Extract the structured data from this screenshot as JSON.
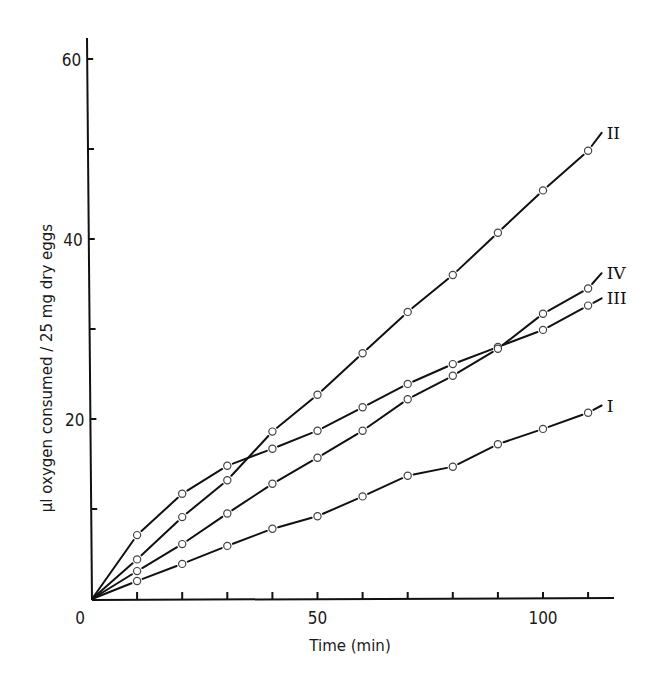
{
  "chart_data": {
    "type": "line",
    "title": "",
    "xlabel": "Time (min)",
    "ylabel": "µl oxygen consumed / 25 mg  dry eggs",
    "xlim": [
      0,
      117
    ],
    "ylim": [
      0,
      62
    ],
    "x_ticks": [
      0,
      10,
      20,
      30,
      40,
      50,
      60,
      70,
      80,
      90,
      100,
      110
    ],
    "x_tick_labels": [
      {
        "value": 0,
        "label": "0"
      },
      {
        "value": 50,
        "label": "50"
      },
      {
        "value": 100,
        "label": "100"
      }
    ],
    "y_ticks": [
      0,
      10,
      20,
      30,
      40,
      50,
      60
    ],
    "y_tick_labels": [
      {
        "value": 20,
        "label": "20"
      },
      {
        "value": 40,
        "label": "40"
      },
      {
        "value": 60,
        "label": "60"
      }
    ],
    "origin_label": "0",
    "grid": false,
    "legend": "inline labels at line ends",
    "marker": "open circle",
    "x": [
      0,
      10,
      20,
      30,
      40,
      50,
      60,
      70,
      80,
      90,
      100,
      110
    ],
    "series": [
      {
        "name": "I",
        "values": [
          0,
          2.0,
          3.9,
          5.9,
          7.8,
          9.2,
          11.4,
          13.7,
          14.7,
          17.2,
          18.9,
          20.7
        ],
        "end": [
          113,
          21.5
        ]
      },
      {
        "name": "II",
        "values": [
          0,
          4.4,
          9.1,
          13.2,
          18.6,
          22.7,
          27.3,
          31.9,
          36.0,
          40.7,
          45.4,
          49.8
        ],
        "end": [
          113,
          51.8
        ]
      },
      {
        "name": "III",
        "values": [
          0,
          7.1,
          11.7,
          14.8,
          16.7,
          18.7,
          21.3,
          23.9,
          26.1,
          28.0,
          29.9,
          32.6
        ],
        "end": [
          113,
          33.4
        ]
      },
      {
        "name": "IV",
        "values": [
          0,
          3.1,
          6.1,
          9.5,
          12.8,
          15.7,
          18.7,
          22.2,
          24.8,
          27.8,
          31.7,
          34.5
        ],
        "end": [
          113,
          36.2
        ]
      }
    ]
  }
}
